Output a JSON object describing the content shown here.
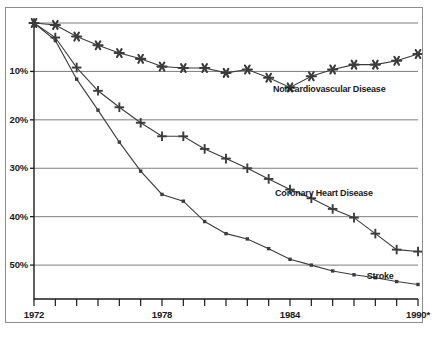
{
  "chart_data": {
    "type": "line",
    "title": "",
    "subtitle": "",
    "xlabel": "",
    "ylabel": "",
    "xlim": [
      1972,
      1990
    ],
    "ylim": [
      0,
      57
    ],
    "y_inverted": true,
    "grid": "horizontal",
    "legend_position": "inline-right",
    "x_tick_labels": [
      "1972",
      "1978",
      "1984",
      "1990*"
    ],
    "x_tick_values": [
      1972,
      1978,
      1984,
      1990
    ],
    "x_minor_tick_values": [
      1972,
      1973,
      1974,
      1975,
      1976,
      1977,
      1978,
      1979,
      1980,
      1981,
      1982,
      1983,
      1984,
      1985,
      1986,
      1987,
      1988,
      1989,
      1990
    ],
    "y_tick_labels": [
      "10%",
      "20%",
      "30%",
      "40%",
      "50%"
    ],
    "y_tick_values": [
      10,
      20,
      30,
      40,
      50
    ],
    "gridline_values": [
      0,
      10,
      20,
      30,
      40,
      50
    ],
    "x": [
      1972,
      1973,
      1974,
      1975,
      1976,
      1977,
      1978,
      1979,
      1980,
      1981,
      1982,
      1983,
      1984,
      1985,
      1986,
      1987,
      1988,
      1989,
      1990
    ],
    "series": [
      {
        "name": "Noncardiovascular Disease",
        "marker": "star",
        "color": "#3c3c3c",
        "label_x": 1983.2,
        "label_y": 13.8,
        "values": [
          0.0,
          0.4,
          2.8,
          4.6,
          6.2,
          7.4,
          9.0,
          9.3,
          9.3,
          10.3,
          9.6,
          11.3,
          13.3,
          11.0,
          9.6,
          8.6,
          8.6,
          7.8,
          6.4
        ]
      },
      {
        "name": "Coronary Heart Disease",
        "marker": "plus",
        "color": "#3c3c3c",
        "label_x": 1983.3,
        "label_y": 35.3,
        "values": [
          0.0,
          3.0,
          9.2,
          14.0,
          17.4,
          20.6,
          23.4,
          23.4,
          26.0,
          28.0,
          30.0,
          32.2,
          34.4,
          36.2,
          38.4,
          40.2,
          43.5,
          46.8,
          47.2
        ]
      },
      {
        "name": "Stroke",
        "marker": "square",
        "color": "#3c3c3c",
        "label_x": 1987.6,
        "label_y": 52.4,
        "values": [
          0.0,
          3.6,
          11.6,
          18.0,
          24.6,
          30.6,
          35.4,
          36.8,
          41.0,
          43.5,
          44.6,
          46.6,
          48.8,
          50.0,
          51.2,
          52.0,
          52.6,
          53.4,
          54.0
        ]
      }
    ]
  },
  "axis": {
    "x_axis_name": "year-axis",
    "y_axis_name": "percent-decline-axis"
  }
}
